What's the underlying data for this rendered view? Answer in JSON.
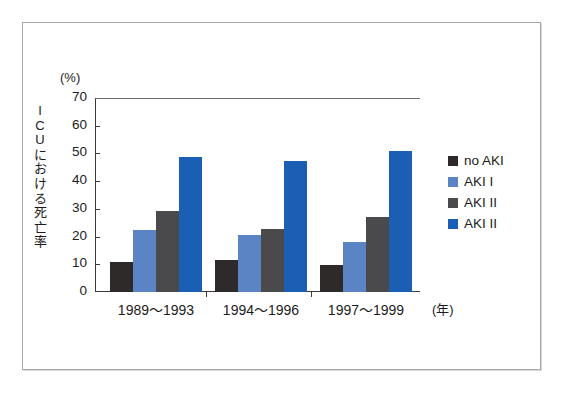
{
  "chart_data": {
    "type": "bar",
    "title": "",
    "subtitle": "",
    "xlabel": "(年)",
    "ylabel": "ICUにおける死亡率",
    "yunit": "(%)",
    "ylim": [
      0,
      70
    ],
    "ytick_step": 10,
    "yticks": [
      "70",
      "60",
      "50",
      "40",
      "30",
      "20",
      "10",
      "0"
    ],
    "ytick_values": [
      70,
      60,
      50,
      40,
      30,
      20,
      10,
      0
    ],
    "grid": false,
    "legend_position": "right",
    "categories": [
      "1989〜1993",
      "1994〜1996",
      "1997〜1999"
    ],
    "series": [
      {
        "name": "no AKI",
        "color": "#2e2a2a",
        "values": [
          11.0,
          11.7,
          9.7
        ]
      },
      {
        "name": "AKI I",
        "color": "#5b84c4",
        "values": [
          22.5,
          20.7,
          18.2
        ]
      },
      {
        "name": "AKI II",
        "color": "#4a4a4c",
        "values": [
          29.4,
          22.7,
          27.0
        ]
      },
      {
        "name": "AKI II",
        "color": "#1b5fb5",
        "values": [
          48.8,
          47.4,
          51.0
        ]
      }
    ]
  },
  "axis_title_chars": [
    "I",
    "C",
    "U",
    "に",
    "お",
    "け",
    "る",
    "死",
    "亡",
    "率"
  ],
  "colors": {
    "frame": "#a8a8a8",
    "axis": "#3a3a3a",
    "text": "#1c1c1c",
    "background": "#ffffff"
  }
}
